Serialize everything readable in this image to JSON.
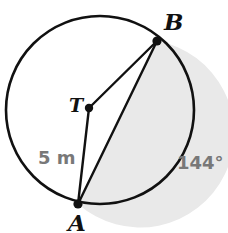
{
  "figure": {
    "kind": "circle-segment-diagram",
    "colors": {
      "background": "#ffffff",
      "stroke": "#111111",
      "segment_fill": "#e9e9e9",
      "segment_fill_edge": "#dedede",
      "point_label": "#111111",
      "measure_label": "#787878"
    },
    "circle": {
      "center_x": 100,
      "center_y": 110,
      "radius": 94,
      "stroke_width": 2.6
    },
    "points": {
      "center": {
        "id": "T",
        "x": 89,
        "y": 108,
        "dot_radius": 4.2
      },
      "a": {
        "id": "A",
        "x": 78,
        "y": 204,
        "dot_radius": 4.6
      },
      "b": {
        "id": "B",
        "x": 157,
        "y": 41,
        "dot_radius": 4.6
      }
    },
    "segment": {
      "shaded": true,
      "bounded_by": "chord AB and major arc from B clockwise to A"
    }
  },
  "labels": {
    "point_b": "B",
    "point_a": "A",
    "center_t": "T",
    "radius_measure": "5 m",
    "arc_angle": "144°"
  },
  "chart_data": {
    "type": "diagram",
    "title": "",
    "shape": "circle",
    "radius_value": 5,
    "radius_units": "m",
    "central_angle_degrees": 144,
    "vertices": [
      "T",
      "A",
      "B"
    ],
    "annotations": [
      {
        "text": "5 m",
        "refers_to": "radius TA"
      },
      {
        "text": "144°",
        "refers_to": "arc AB / central angle at T"
      }
    ]
  }
}
